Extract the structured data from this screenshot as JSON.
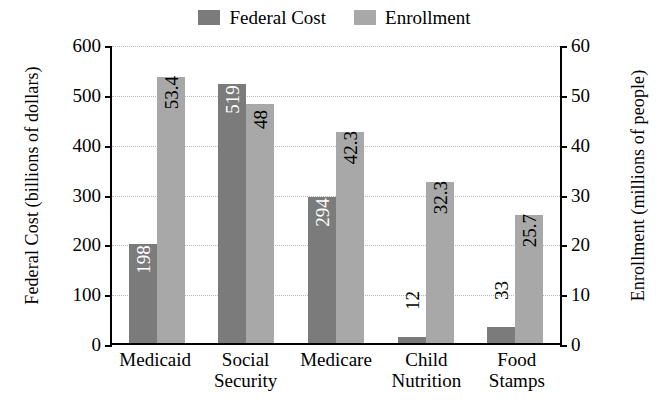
{
  "legend": {
    "items": [
      {
        "label": "Federal Cost",
        "color": "#7b7b7b",
        "icon": "legend-swatch-federal-cost"
      },
      {
        "label": "Enrollment",
        "color": "#a8a8a8",
        "icon": "legend-swatch-enrollment"
      }
    ]
  },
  "chart_data": {
    "type": "bar",
    "title": "",
    "subtitle": "",
    "xlabel": "",
    "ylabel": "Federal Cost (billions of dollars)",
    "y2label": "Enrollment (millions of people)",
    "categories": [
      "Medicaid",
      "Social Security",
      "Medicare",
      "Child Nutrition",
      "Food Stamps"
    ],
    "category_lines": [
      [
        "Medicaid"
      ],
      [
        "Social",
        "Security"
      ],
      [
        "Medicare"
      ],
      [
        "Child",
        "Nutrition"
      ],
      [
        "Food",
        "Stamps"
      ]
    ],
    "series": [
      {
        "name": "Federal Cost",
        "axis": "left",
        "color": "#7b7b7b",
        "values": [
          198,
          519,
          294,
          12,
          33
        ],
        "labels": [
          "198",
          "519",
          "294",
          "12",
          "33"
        ]
      },
      {
        "name": "Enrollment",
        "axis": "right",
        "color": "#a8a8a8",
        "values": [
          53.4,
          48,
          42.3,
          32.3,
          25.7
        ],
        "labels": [
          "53.4",
          "48",
          "42.3",
          "32.3",
          "25.7"
        ]
      }
    ],
    "ylim": [
      0,
      600
    ],
    "yticks": [
      0,
      100,
      200,
      300,
      400,
      500,
      600
    ],
    "ytick_labels": [
      "0",
      "100",
      "200",
      "300",
      "400",
      "500",
      "600"
    ],
    "y2lim": [
      0,
      60
    ],
    "y2ticks": [
      0,
      10,
      20,
      30,
      40,
      50,
      60
    ],
    "y2tick_labels": [
      "0",
      "10",
      "20",
      "30",
      "40",
      "50",
      "60"
    ],
    "grid": true,
    "legend_position": "top-center"
  }
}
